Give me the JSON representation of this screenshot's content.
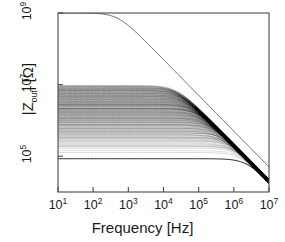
{
  "chart_data": {
    "type": "line",
    "title": "",
    "subtitle": "",
    "xlabel": "Frequency [Hz]",
    "ylabel": "|Zout| [Ω]",
    "ylabel_parts": {
      "prefix": "|Z",
      "sub": "out",
      "suffix": "| [Ω]"
    },
    "xscale": "log",
    "yscale": "log",
    "xlim": [
      10,
      10000000
    ],
    "ylim": [
      10000,
      1000000000
    ],
    "grid": false,
    "legend": null,
    "xticks": [
      10,
      100,
      1000,
      10000,
      100000,
      1000000,
      10000000
    ],
    "xtick_labels": [
      "10",
      "10",
      "10",
      "10",
      "10",
      "10",
      "10"
    ],
    "xtick_exponents": [
      "1",
      "2",
      "3",
      "4",
      "5",
      "6",
      "7"
    ],
    "yticks": [
      100000,
      10000000,
      1000000000
    ],
    "ytick_labels": [
      "10",
      "10",
      "10"
    ],
    "ytick_exponents": [
      "5",
      "7",
      "9"
    ],
    "annotations": [],
    "series": [
      {
        "name": "upper-envelope",
        "color": "#6e6e6e",
        "width": 1.0,
        "dc_value": 1000000000,
        "corner_hz": 500,
        "slope_db_per_decade": -20
      },
      {
        "name": "ensemble-bundle",
        "color": "#000000",
        "count": 420,
        "dc_min": 85000,
        "dc_max": 9500000,
        "corner_min_hz": 90000,
        "corner_max_hz": 2600000,
        "tip_hz": 10000000,
        "tip_value": 20000,
        "alpha": 0.1
      }
    ],
    "envelope_points": {
      "upper_f": [
        10,
        100,
        300,
        500,
        1000,
        2000,
        5000,
        10000,
        30000,
        100000,
        300000,
        1000000,
        3000000,
        10000000
      ],
      "upper_z": [
        1000000000.0,
        1000000000.0,
        960000000.0,
        870000000.0,
        530000000.0,
        280000000.0,
        115000000.0,
        58000000.0,
        19500000.0,
        5800000.0,
        1900000.0,
        560000.0,
        170000.0,
        30000.0
      ],
      "band_top_f": [
        10,
        1000,
        10000,
        100000,
        300000,
        1000000,
        3000000,
        10000000
      ],
      "band_top_z": [
        9500000.0,
        9500000.0,
        9400000.0,
        8600000.0,
        5000000.0,
        1600000.0,
        340000.0,
        30000.0
      ],
      "band_bottom_f": [
        10,
        1000,
        100000,
        1000000,
        3000000,
        6000000,
        10000000
      ],
      "band_bottom_z": [
        85000.0,
        85000.0,
        84000.0,
        78000.0,
        62000.0,
        40000.0,
        20000.0
      ]
    }
  },
  "figure": {
    "background": "#ffffff",
    "frame_color": "#4a4a4a",
    "text_color": "#1a1a1a",
    "curve_color": "#000000",
    "envelope_color": "#6e6e6e"
  }
}
